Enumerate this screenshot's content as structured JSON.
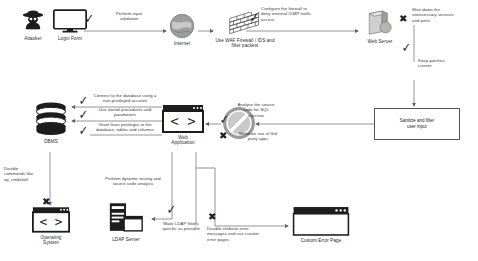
{
  "diagram": {
    "type": "flow-diagram",
    "colors": {
      "line": "#6e6e6e",
      "text": "#3a3a3a",
      "icon_dark": "#1d1d1d",
      "icon_mid": "#8a8a8a",
      "box_border": "#555555",
      "background": "#ffffff"
    }
  },
  "nodes": [
    {
      "id": "attacker",
      "label": "Attacker",
      "icon": "hacker-icon"
    },
    {
      "id": "login_form",
      "label": "Login Form",
      "icon": "monitor-icon"
    },
    {
      "id": "internet",
      "label": "Internet",
      "icon": "globe-icon"
    },
    {
      "id": "firewall",
      "label": "Use WAF Firewall / IDS and\nfilter packets",
      "icon": "firewall-brick-icon"
    },
    {
      "id": "web_server",
      "label": "Web Server",
      "icon": "server-icon"
    },
    {
      "id": "dbms",
      "label": "DBMS",
      "icon": "database-icon"
    },
    {
      "id": "web_app",
      "label": "Web\nApplication",
      "icon": "code-window-icon"
    },
    {
      "id": "no_entry",
      "label": "",
      "icon": "no-entry-icon"
    },
    {
      "id": "sanitize_box",
      "label": "Sanitize and filter\nuser input",
      "icon": "process-box"
    },
    {
      "id": "os",
      "label": "Operating\nSystem",
      "icon": "code-window-icon"
    },
    {
      "id": "ldap",
      "label": "LDAP Server",
      "icon": "ldap-server-icon"
    },
    {
      "id": "error_page",
      "label": "Custom Error Page",
      "icon": "browser-window-icon"
    }
  ],
  "annotations": [
    {
      "id": "a1",
      "mark": "check",
      "text": "Perform input\nvalidation"
    },
    {
      "id": "a2",
      "mark": "check",
      "text": "Configure the firewall to\ndeny external ICMP traffic\naccess"
    },
    {
      "id": "a3",
      "mark": "cross",
      "text": "Shut down the\nunnecessary services\nand ports"
    },
    {
      "id": "a4",
      "mark": "check",
      "text": "Keep patches\ncurrent"
    },
    {
      "id": "a5",
      "mark": "check",
      "text": "Connect to the database using a\nnon-privileged account"
    },
    {
      "id": "a6",
      "mark": "check",
      "text": "Use stored procedures and\nparameters"
    },
    {
      "id": "a7",
      "mark": "check",
      "text": "Grant least privileges to the\ndatabase, tables and columns"
    },
    {
      "id": "a8",
      "mark": "check",
      "text": "Analyse the source\ncode for SQL\ninjection"
    },
    {
      "id": "a9",
      "mark": "cross",
      "text": "Minimize use of 3rd\nparty apps"
    },
    {
      "id": "a10",
      "mark": "cross",
      "text": "Disable\ncommands like\nxp_cmdshell"
    },
    {
      "id": "a11",
      "mark": "check",
      "text": "Perform dynamic testing and\nsource code analysis"
    },
    {
      "id": "a12",
      "mark": "check",
      "text": "Make LDAP filter's\nspecific as possible"
    },
    {
      "id": "a13",
      "mark": "cross",
      "text": "Disable verbose error\nmessages and use custom\nerror pages"
    }
  ]
}
